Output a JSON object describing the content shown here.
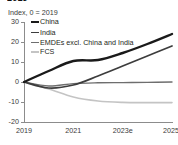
{
  "title": "2019",
  "axis_subtitle": "Index, 0 = 2019",
  "legend": {
    "items": [
      {
        "label": "China",
        "color": "#1a1a1a"
      },
      {
        "label": "India",
        "color": "#3d3d3d"
      },
      {
        "label": "EMDEs excl. China and India",
        "color": "#6e6e6e"
      },
      {
        "label": "FCS",
        "color": "#c4c4c4"
      }
    ]
  },
  "chart_data": {
    "type": "line",
    "title": "2019",
    "subtitle": "Index, 0 = 2019",
    "xlabel": "",
    "ylabel": "Index, 0 = 2019",
    "x": [
      2019,
      2020,
      2021,
      2022,
      2023,
      2024,
      2025
    ],
    "categories": [
      "2019",
      "2020",
      "2021",
      "2022",
      "2023e",
      "2024f",
      "2025f"
    ],
    "tick_labels": [
      "2019",
      "2021",
      "2023e",
      "2025f"
    ],
    "ylim": [
      -20,
      30
    ],
    "yticks": [
      30,
      20,
      10,
      0,
      -10,
      -20
    ],
    "grid": false,
    "legend_position": "top-left",
    "series": [
      {
        "name": "China",
        "color": "#1a1a1a",
        "values": [
          0,
          5.5,
          10.5,
          11.0,
          14.5,
          19.0,
          24.0
        ]
      },
      {
        "name": "India",
        "color": "#3d3d3d",
        "values": [
          0,
          -3.0,
          -1.5,
          3.0,
          8.0,
          13.0,
          18.0
        ]
      },
      {
        "name": "EMDEs excl. China and India",
        "color": "#6e6e6e",
        "values": [
          0,
          -2.0,
          -0.8,
          -0.4,
          -0.3,
          -0.2,
          0.0
        ]
      },
      {
        "name": "FCS",
        "color": "#c4c4c4",
        "values": [
          0,
          -3.5,
          -7.5,
          -9.5,
          -10.2,
          -10.3,
          -10.3
        ]
      }
    ]
  }
}
